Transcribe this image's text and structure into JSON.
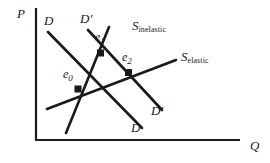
{
  "figure": {
    "kind": "supply-demand-diagram",
    "axes": {
      "y_label": "P",
      "x_label": "Q",
      "y_axis_name": "price-axis",
      "x_axis_name": "quantity-axis"
    },
    "curves": [
      {
        "id": "demand-original",
        "label": "D",
        "label_top": "D",
        "label_bottom": "D",
        "type": "demand"
      },
      {
        "id": "demand-shifted",
        "label": "D'",
        "label_top": "D",
        "label_bottom": "D",
        "prime": "′",
        "type": "demand"
      },
      {
        "id": "supply-inelastic",
        "label_base": "S",
        "label_sub": "inelastic",
        "type": "supply"
      },
      {
        "id": "supply-elastic",
        "label_base": "S",
        "label_sub": "elastic",
        "type": "supply"
      }
    ],
    "equilibria": [
      {
        "id": "e0",
        "base": "e",
        "sub": "0"
      },
      {
        "id": "e1",
        "base": "e",
        "sub": "1"
      },
      {
        "id": "e2",
        "base": "e",
        "sub": "2"
      }
    ],
    "colors": {
      "line": "#1a1a1a",
      "frame": "#1a1a1a",
      "background": "#ffffff"
    }
  }
}
